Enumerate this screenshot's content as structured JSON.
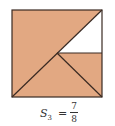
{
  "figure": {
    "label": "S3 geometric series square",
    "colors": {
      "fill": "#e2a882",
      "stroke": "#3a2a22",
      "unfilled": "#ffffff"
    },
    "square": {
      "x": 12,
      "y": 10,
      "size": 90
    },
    "junction": {
      "x": 57,
      "y": 53
    }
  },
  "caption": {
    "symbol": "S",
    "subscript": "3",
    "equals": "=",
    "numerator": "7",
    "denominator": "8"
  }
}
